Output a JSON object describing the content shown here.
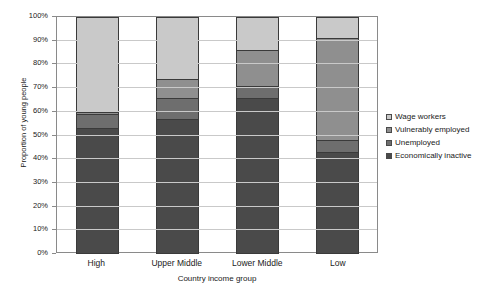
{
  "chart_data": {
    "type": "bar",
    "subtype": "stacked-column-100pct",
    "title": "",
    "xlabel": "Country income group",
    "ylabel": "Proportion of young people",
    "categories": [
      "High",
      "Upper Middle",
      "Lower Middle",
      "Low"
    ],
    "ylim": [
      0,
      100
    ],
    "ytick_labels": [
      "0%",
      "10%",
      "20%",
      "30%",
      "40%",
      "50%",
      "60%",
      "70%",
      "80%",
      "90%",
      "100%"
    ],
    "ytick_values": [
      0,
      10,
      20,
      30,
      40,
      50,
      60,
      70,
      80,
      90,
      100
    ],
    "grid": true,
    "grid_axis": "y",
    "legend_position": "right",
    "stack_order_bottom_to_top": [
      "Economically inactive",
      "Unemployed",
      "Vulnerably employed",
      "Wage workers"
    ],
    "series": [
      {
        "name": "Economically inactive",
        "color": "#4a4a4a",
        "values": [
          53,
          57,
          66,
          43
        ]
      },
      {
        "name": "Unemployed",
        "color": "#6e6e6e",
        "values": [
          6,
          9,
          5,
          5
        ]
      },
      {
        "name": "Vulnerably employed",
        "color": "#8f8f8f",
        "values": [
          1,
          8,
          15,
          43
        ]
      },
      {
        "name": "Wage workers",
        "color": "#c9c9c9",
        "values": [
          40,
          26,
          14,
          9
        ]
      }
    ],
    "cumulative_tops": {
      "High": [
        53,
        59,
        60,
        100
      ],
      "Upper Middle": [
        57,
        66,
        74,
        100
      ],
      "Lower Middle": [
        66,
        71,
        86,
        100
      ],
      "Low": [
        43,
        48,
        91,
        100
      ]
    }
  },
  "legend": {
    "items": [
      {
        "label": "Wage workers",
        "color": "#c9c9c9"
      },
      {
        "label": "Vulnerably employed",
        "color": "#8f8f8f"
      },
      {
        "label": "Unemployed",
        "color": "#6e6e6e"
      },
      {
        "label": "Economically inactive",
        "color": "#4a4a4a"
      }
    ]
  },
  "axes": {
    "y_title": "Proportion of young people",
    "x_title": "Country income group"
  },
  "colors": {
    "plot_border": "#8a8a8a",
    "gridline": "#c9c9c9",
    "bar_outline": "#3a3a3a",
    "background": "#ffffff",
    "text": "#1a1a1a"
  }
}
